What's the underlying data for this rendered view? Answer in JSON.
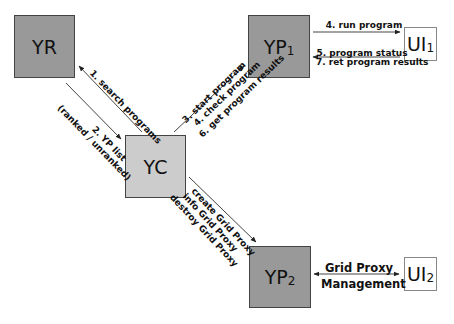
{
  "nodes": {
    "yr": {
      "label": "YR",
      "sub": ""
    },
    "yc": {
      "label": "YC",
      "sub": ""
    },
    "yp1": {
      "label": "YP",
      "sub": "1"
    },
    "yp2": {
      "label": "YP",
      "sub": "2"
    },
    "ui1": {
      "label": "UI",
      "sub": "1"
    },
    "ui2": {
      "label": "UI",
      "sub": "2"
    }
  },
  "edges": {
    "yc_to_yr": {
      "label": "1. search programs"
    },
    "yr_to_yc": {
      "label_line1": "2. YP list",
      "label_line2": "(ranked / unranked)"
    },
    "yc_to_yp1": {
      "line1": "3. start program",
      "line2": "4. check program",
      "line3": "6. get program results"
    },
    "yp1_to_ui1": {
      "label": "4. run program"
    },
    "ui1_to_yp1": {
      "line1": "5. program status",
      "line2": "7. ret program results"
    },
    "yc_to_yp2": {
      "line1": "create Grid Proxy",
      "line2": "info Grid Proxy",
      "line3": "destroy Grid Proxy"
    },
    "yp2_ui2": {
      "line1": "Grid Proxy",
      "line2": "Management"
    }
  },
  "colors": {
    "dark_node": "#999999",
    "light_node": "#cccccc",
    "ui_node": "#ffffff",
    "line": "#333333"
  }
}
